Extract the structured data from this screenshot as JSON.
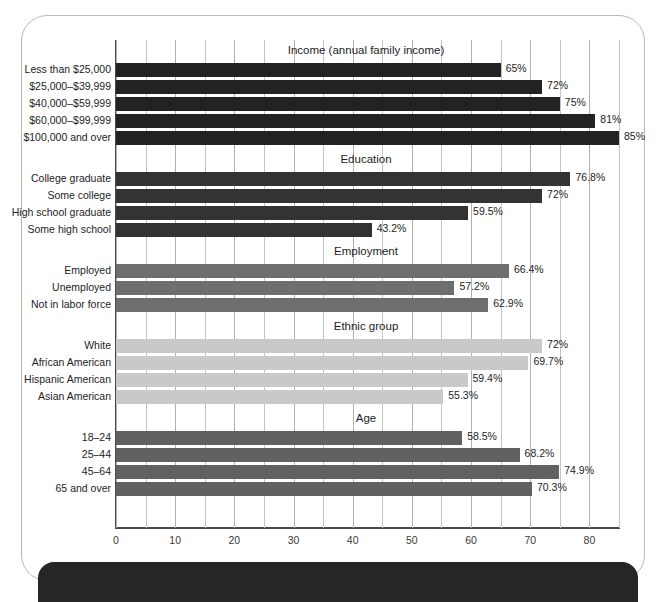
{
  "chart_data": {
    "type": "bar",
    "orientation": "horizontal",
    "title": "",
    "xlabel": "",
    "ylabel": "",
    "xlim": [
      0,
      85
    ],
    "xticks": [
      "0",
      "10",
      "20",
      "30",
      "40",
      "50",
      "60",
      "70",
      "80"
    ],
    "xtick_values": [
      0,
      10,
      20,
      30,
      40,
      50,
      60,
      70,
      80
    ],
    "minor_gridline_step": 5,
    "grid": true,
    "legend": "none",
    "value_suffix": "%",
    "groups": [
      {
        "name": "Income (annual family income)",
        "color": "#222222",
        "categories": [
          "Less than $25,000",
          "$25,000–$39,999",
          "$40,000–$59,999",
          "$60,000–$99,999",
          "$100,000 and over"
        ],
        "values": [
          65,
          72,
          75,
          81,
          85
        ],
        "labels": [
          "65%",
          "72%",
          "75%",
          "81%",
          "85%"
        ]
      },
      {
        "name": "Education",
        "color": "#333333",
        "categories": [
          "College graduate",
          "Some college",
          "High school graduate",
          "Some high school"
        ],
        "values": [
          76.8,
          72,
          59.5,
          43.2
        ],
        "labels": [
          "76.8%",
          "72%",
          "59.5%",
          "43.2%"
        ]
      },
      {
        "name": "Employment",
        "color": "#6e6e6e",
        "categories": [
          "Employed",
          "Unemployed",
          "Not in labor force"
        ],
        "values": [
          66.4,
          57.2,
          62.9
        ],
        "labels": [
          "66.4%",
          "57.2%",
          "62.9%"
        ]
      },
      {
        "name": "Ethnic group",
        "color": "#c9c9c9",
        "categories": [
          "White",
          "African American",
          "Hispanic American",
          "Asian American"
        ],
        "values": [
          72,
          69.7,
          59.4,
          55.3
        ],
        "labels": [
          "72%",
          "69.7%",
          "59.4%",
          "55.3%"
        ]
      },
      {
        "name": "Age",
        "color": "#616161",
        "categories": [
          "18–24",
          "25–44",
          "45–64",
          "65 and over"
        ],
        "values": [
          58.5,
          68.2,
          74.9,
          70.3
        ],
        "labels": [
          "58.5%",
          "68.2%",
          "74.9%",
          "70.3%"
        ]
      }
    ]
  }
}
